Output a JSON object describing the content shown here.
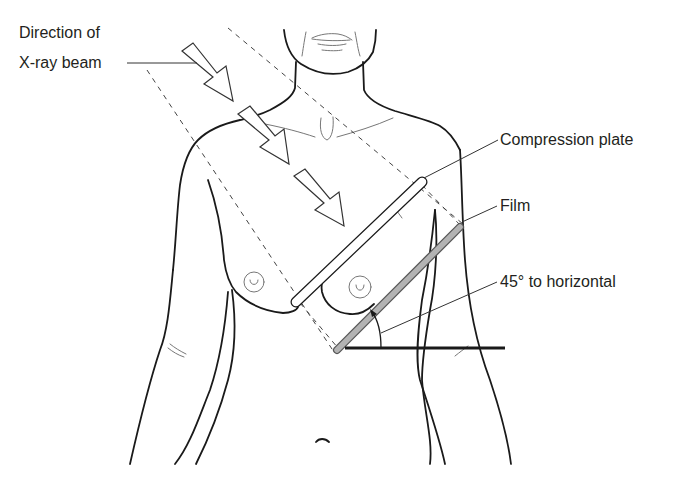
{
  "diagram": {
    "type": "anatomical-positioning",
    "labels": {
      "beam_line1": "Direction of",
      "beam_line2": "X-ray beam",
      "compression_plate": "Compression plate",
      "film": "Film",
      "angle": "45° to horizontal"
    },
    "colors": {
      "outline": "#1a1a1a",
      "film_fill": "#b3b3b3",
      "plate_fill": "#ffffff",
      "text": "#231f20"
    },
    "elements": {
      "beam_arrows": 3,
      "angle_degrees": 45
    }
  }
}
